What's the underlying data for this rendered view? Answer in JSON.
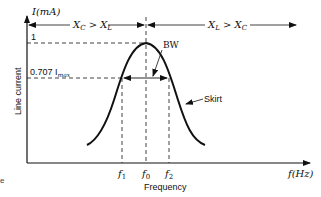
{
  "diagram": {
    "type": "resonance-curve",
    "y_axis_label": "I(mA)",
    "y_axis_title": "Line current",
    "x_axis_label": "f(Hz)",
    "x_axis_title": "Frequency",
    "level_peak_label": "1",
    "level_half_label": "0.707 I",
    "level_half_sub": "max",
    "region_left_label": "X",
    "region_left_sub1": "C",
    "region_left_mid": " > X",
    "region_left_sub2": "L",
    "region_right_label": "X",
    "region_right_sub1": "L",
    "region_right_mid": " > X",
    "region_right_sub2": "C",
    "bw_label": "BW",
    "skirt_label": "Skirt",
    "tick_f1": "f",
    "tick_f1_sub": "1",
    "tick_f0": "f",
    "tick_f0_sub": "0",
    "tick_f2": "f",
    "tick_f2_sub": "2",
    "stray_char": "e",
    "colors": {
      "line": "#111111",
      "background": "#ffffff"
    }
  }
}
